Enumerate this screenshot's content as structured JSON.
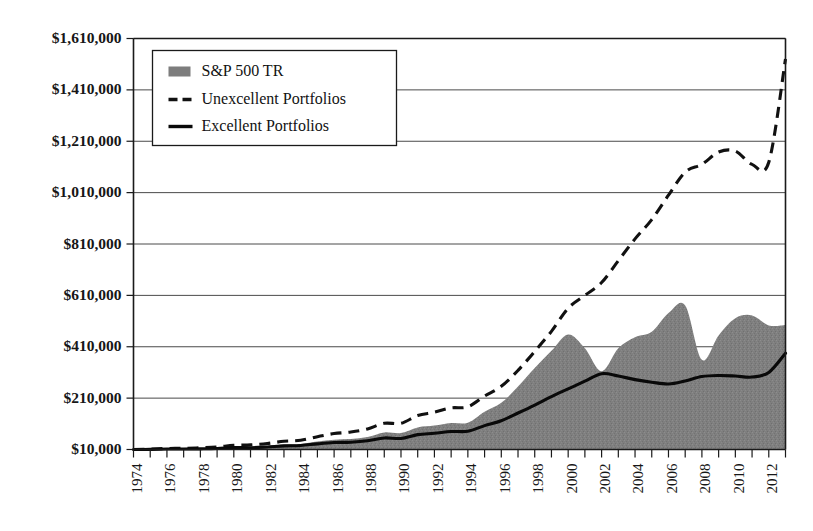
{
  "chart_data": {
    "type": "area",
    "title": "",
    "subtitle": "",
    "xlabel": "",
    "ylabel": "",
    "grid": "horizontal",
    "legend_position": "top-left",
    "xlim": [
      1974,
      2013
    ],
    "ylim": [
      10000,
      1610000
    ],
    "y_ticks": [
      10000,
      210000,
      410000,
      610000,
      810000,
      1010000,
      1210000,
      1410000,
      1610000
    ],
    "y_tick_labels": [
      "$10,000",
      "$210,000",
      "$410,000",
      "$610,000",
      "$810,000",
      "$1,010,000",
      "$1,210,000",
      "$1,410,000",
      "$1,610,000"
    ],
    "x": [
      1974,
      1975,
      1976,
      1977,
      1978,
      1979,
      1980,
      1981,
      1982,
      1983,
      1984,
      1985,
      1986,
      1987,
      1988,
      1989,
      1990,
      1991,
      1992,
      1993,
      1994,
      1995,
      1996,
      1997,
      1998,
      1999,
      2000,
      2001,
      2002,
      2003,
      2004,
      2005,
      2006,
      2007,
      2008,
      2009,
      2010,
      2011,
      2012,
      2013
    ],
    "x_tick_labels": [
      "1974",
      "1976",
      "1978",
      "1980",
      "1982",
      "1984",
      "1986",
      "1988",
      "1990",
      "1992",
      "1994",
      "1996",
      "1998",
      "2000",
      "2002",
      "2004",
      "2006",
      "2008",
      "2010",
      "2012"
    ],
    "x_tick_label_years": [
      1974,
      1976,
      1978,
      1980,
      1982,
      1984,
      1986,
      1988,
      1990,
      1992,
      1994,
      1996,
      1998,
      2000,
      2002,
      2004,
      2006,
      2008,
      2010,
      2012
    ],
    "x_tick_label_rotation": -90,
    "series": [
      {
        "name": "S&P 500 TR",
        "style": "area",
        "color": "#7d7d7d",
        "values": [
          10000,
          11000,
          13500,
          13000,
          13800,
          16200,
          21000,
          20200,
          24200,
          29500,
          31200,
          40800,
          48000,
          50500,
          58500,
          76500,
          74000,
          96000,
          103000,
          113000,
          114500,
          157000,
          192000,
          255000,
          327000,
          394000,
          458000,
          404000,
          315000,
          404000,
          447000,
          468000,
          541000,
          571000,
          359000,
          454000,
          521000,
          532000,
          493000,
          495000
        ]
      },
      {
        "name": "Unexcellent Portfolios",
        "style": "dashed-line",
        "color": "#111111",
        "values": [
          10000,
          11500,
          14000,
          14500,
          16500,
          20000,
          26000,
          28000,
          33500,
          42000,
          46000,
          60000,
          72000,
          78000,
          90000,
          112000,
          112000,
          142000,
          155000,
          172000,
          176000,
          218000,
          256000,
          318000,
          392000,
          470000,
          560000,
          610000,
          660000,
          745000,
          830000,
          905000,
          1000000,
          1090000,
          1120000,
          1168000,
          1172000,
          1120000,
          1128000,
          1530000
        ]
      },
      {
        "name": "Excellent Portfolios",
        "style": "solid-line",
        "color": "#090909",
        "values": [
          10000,
          10500,
          12000,
          11800,
          12500,
          14000,
          17500,
          17000,
          20000,
          24000,
          25500,
          32000,
          37000,
          38500,
          44000,
          55000,
          53000,
          68000,
          73000,
          80000,
          81000,
          103000,
          122000,
          152000,
          183000,
          216000,
          246000,
          276000,
          305000,
          296000,
          282000,
          272000,
          265000,
          277000,
          294000,
          298000,
          296000,
          292000,
          310000,
          385000
        ]
      }
    ]
  },
  "legend": {
    "entries": [
      {
        "label": "S&P 500 TR",
        "marker": "filled-square-swatch"
      },
      {
        "label": "Unexcellent Portfolios",
        "marker": "dashed-line-swatch"
      },
      {
        "label": "Excellent Portfolios",
        "marker": "solid-line-swatch"
      }
    ]
  },
  "colors": {
    "area_fill": "#7d7d7d",
    "dashed_line": "#111111",
    "solid_line": "#090909",
    "gridline": "#4a4a4a",
    "axis": "#1a1a1a",
    "background": "#ffffff"
  }
}
